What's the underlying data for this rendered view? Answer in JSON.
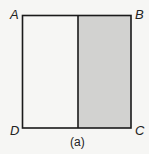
{
  "diagram": {
    "type": "geometry-square",
    "vertices": {
      "top_left": "A",
      "top_right": "B",
      "bottom_right": "C",
      "bottom_left": "D"
    },
    "shaded_region": "right half",
    "caption": "(a)",
    "colors": {
      "stroke": "#1a1a1a",
      "shade": "#d2d2d0",
      "background": "#f6f6f4"
    }
  }
}
